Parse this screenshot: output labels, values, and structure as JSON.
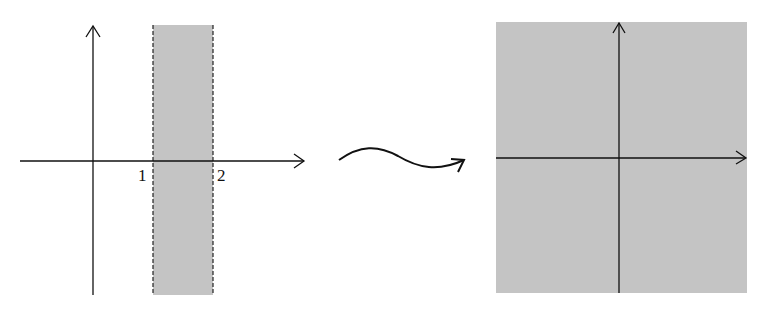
{
  "diagram": {
    "type": "conformal-map-illustration",
    "left_panel": {
      "description": "Vertical strip between Re z = 1 and Re z = 2 (dashed boundaries, shaded)",
      "strip_fill": "#c4c4c4",
      "tick_labels": [
        "1",
        "2"
      ]
    },
    "mapping_arrow": {
      "description": "Wavy arrow indicating a mapping"
    },
    "right_panel": {
      "description": "Entire plane shaded with coordinate axes",
      "fill": "#c4c4c4"
    },
    "colors": {
      "axis": "#111111",
      "shade": "#c4c4c4"
    }
  }
}
